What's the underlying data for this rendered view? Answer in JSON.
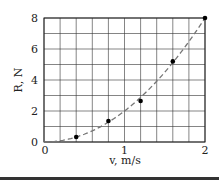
{
  "chart_data": {
    "type": "scatter",
    "title": "",
    "xlabel": "v, m/s",
    "ylabel": "R, N",
    "xlim": [
      0,
      2
    ],
    "ylim": [
      0,
      8
    ],
    "x_ticks": [
      "0",
      "1",
      "2"
    ],
    "y_ticks": [
      "0",
      "2",
      "4",
      "6",
      "8"
    ],
    "grid": true,
    "grid_step_x": 0.2,
    "grid_step_y": 1,
    "legend": null,
    "series": [
      {
        "name": "measurements",
        "style": "points",
        "x": [
          0.4,
          0.8,
          1.2,
          1.6,
          2.0
        ],
        "y": [
          0.32,
          1.35,
          2.65,
          5.2,
          8.0
        ]
      },
      {
        "name": "fit curve",
        "style": "dashed",
        "formula": "R = 2 v^2",
        "x": [
          0,
          0.2,
          0.4,
          0.6,
          0.8,
          1.0,
          1.2,
          1.4,
          1.6,
          1.8,
          2.0
        ],
        "y": [
          0,
          0.08,
          0.32,
          0.72,
          1.28,
          2.0,
          2.88,
          3.92,
          5.12,
          6.48,
          8.0
        ]
      }
    ],
    "colors": {
      "axis": "#222222",
      "grid": "#333333",
      "points": "#000000",
      "curve": "#777777"
    }
  }
}
